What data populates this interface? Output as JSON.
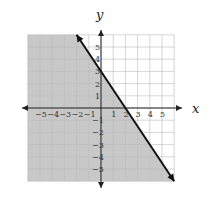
{
  "chart_data": {
    "type": "line",
    "title": "",
    "subtitle": "Graph of linear inequality, shaded half-plane",
    "xlabel": "x",
    "ylabel": "y",
    "xlim": [
      -6,
      6
    ],
    "ylim": [
      -6,
      6
    ],
    "grid": true,
    "x_ticks": [
      "-5",
      "-4",
      "-3",
      "-2",
      "-1",
      "1",
      "2",
      "3",
      "4",
      "5"
    ],
    "y_ticks": [
      "5",
      "4",
      "3",
      "2",
      "1",
      "-1",
      "-2",
      "-3",
      "-4",
      "-5"
    ],
    "series": [
      {
        "name": "boundary line y = -3/2 x + 3",
        "style": "solid",
        "arrows": "both",
        "x": [
          -2,
          6
        ],
        "y": [
          6,
          -6
        ],
        "intercepts": {
          "x": 2,
          "y": 3
        }
      }
    ],
    "shaded_region": {
      "side": "below-left",
      "inequality": "y ≤ -3/2 x + 3",
      "color": "#c8c8c8"
    }
  },
  "labels": {
    "x_axis": "x",
    "y_axis": "y"
  }
}
